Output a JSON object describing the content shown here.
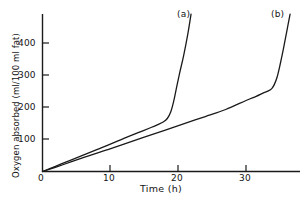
{
  "chart_data": {
    "type": "line",
    "title": "",
    "xlabel": "Time (h)",
    "ylabel": "Oxygen absorbed (ml/100 ml fat)",
    "xlim": [
      0,
      39
    ],
    "ylim": [
      0,
      490
    ],
    "grid": false,
    "legend_position": "inline-curve-labels",
    "xticks": [
      0,
      10,
      20,
      30
    ],
    "xtick_labels": [
      "0",
      "10",
      "20",
      "30"
    ],
    "yticks": [
      100,
      200,
      300,
      400
    ],
    "ytick_labels": [
      "100",
      "200",
      "300",
      "400"
    ],
    "series": [
      {
        "name": "(a)",
        "label": "(a)",
        "color": "#1a1a1a",
        "x": [
          0,
          2,
          4,
          6,
          8,
          10,
          12,
          14,
          16,
          17,
          17.8,
          18.4,
          18.9,
          19.3,
          19.7,
          20.2,
          20.8,
          21.4,
          21.9
        ],
        "y": [
          0,
          17,
          34,
          51,
          68,
          85,
          103,
          120,
          137,
          146,
          154,
          165,
          185,
          215,
          255,
          305,
          360,
          425,
          490
        ]
      },
      {
        "name": "(b)",
        "label": "(b)",
        "color": "#1a1a1a",
        "x": [
          0,
          3,
          6,
          9,
          12,
          15,
          18,
          21,
          24,
          27,
          30,
          31.5,
          32.5,
          33.2,
          33.8,
          34.2,
          34.6,
          35.0,
          35.5,
          36.0,
          36.5
        ],
        "y": [
          0,
          21,
          43,
          64,
          85,
          107,
          128,
          150,
          171,
          193,
          221,
          234,
          244,
          250,
          258,
          272,
          295,
          330,
          380,
          435,
          490
        ]
      }
    ],
    "annotations": [
      {
        "text": "(a)",
        "x": 20.3,
        "y": 487
      },
      {
        "text": "(b)",
        "x": 34.3,
        "y": 487
      }
    ]
  },
  "axes": {
    "y_title": "Oxygen absorbed (ml/100 ml fat)",
    "x_title": "Time (h)",
    "y_ticks": [
      {
        "label": "400"
      },
      {
        "label": "300"
      },
      {
        "label": "200"
      },
      {
        "label": "100"
      }
    ],
    "x_ticks": [
      {
        "label": "0"
      },
      {
        "label": "10"
      },
      {
        "label": "20"
      },
      {
        "label": "30"
      }
    ]
  },
  "curve_labels": {
    "a": "(a)",
    "b": "(b)"
  }
}
